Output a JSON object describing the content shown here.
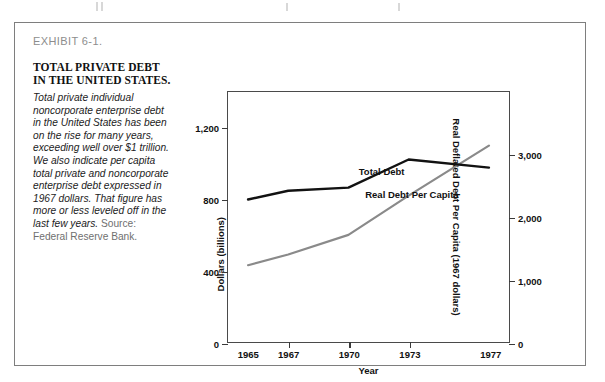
{
  "exhibit": {
    "label": "EXHIBIT 6-1.",
    "title": "TOTAL PRIVATE DEBT IN THE UNITED STATES.",
    "body": "Total private individual noncorporate enterprise debt in the United States has been on the rise for many years, exceeding well over $1 trillion. We also indicate per capita total private and noncorporate enterprise debt expressed in 1967 dollars. That figure has more or less leveled off in the last few years. ",
    "source": "Source: Federal Reserve Bank."
  },
  "chart_data": {
    "type": "line",
    "title": "TOTAL PRIVATE DEBT IN THE UNITED STATES.",
    "xlabel": "Year",
    "ylabel": "Dollars (billions)",
    "ylabel_right": "Real Deflated Debt Per Capita (1967 dollars)",
    "x": [
      1965,
      1967,
      1970,
      1973,
      1977
    ],
    "xticklabels": [
      "1965",
      "1967",
      "1970",
      "1973",
      "1977"
    ],
    "xlim": [
      1964,
      1978
    ],
    "ylim": [
      0,
      1400
    ],
    "yticks": [
      0,
      400,
      800,
      1200
    ],
    "yticklabels": [
      "0",
      "400",
      "800",
      "1,200"
    ],
    "ylim_right": [
      0,
      4000
    ],
    "yticks_right": [
      0,
      1000,
      2000,
      3000
    ],
    "yticklabels_right": [
      "0",
      "1,000",
      "2,000",
      "3,000"
    ],
    "grid": false,
    "legend": "inline-labels",
    "series": [
      {
        "name": "Total Debt",
        "axis": "left",
        "color": "#8a8a8a",
        "values": [
          430,
          490,
          600,
          820,
          1100
        ],
        "label_x": 1971.6,
        "label_y": 960
      },
      {
        "name": "Real Debt Per Capita",
        "axis": "right",
        "color": "#121212",
        "values": [
          2280,
          2420,
          2470,
          2920,
          2790
        ],
        "label_x": 1973.1,
        "label_y": 2380
      }
    ]
  }
}
